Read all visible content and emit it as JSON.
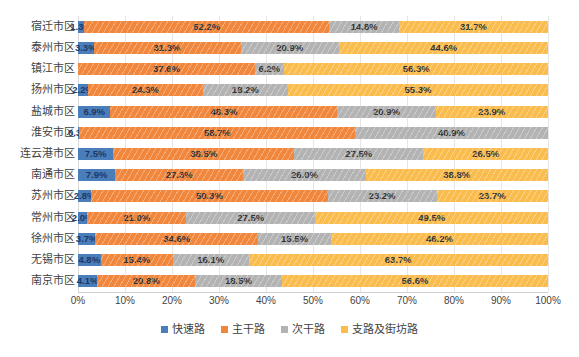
{
  "chart_data": {
    "type": "bar",
    "subtype": "stacked-100-horizontal",
    "title": "",
    "xlabel": "",
    "ylabel": "",
    "xlim": [
      0,
      100
    ],
    "grid": true,
    "legend_position": "bottom",
    "x_ticks": [
      "0%",
      "10%",
      "20%",
      "30%",
      "40%",
      "50%",
      "60%",
      "70%",
      "80%",
      "90%",
      "100%"
    ],
    "x_tick_values": [
      0,
      10,
      20,
      30,
      40,
      50,
      60,
      70,
      80,
      90,
      100
    ],
    "categories": [
      "宿迁市区",
      "泰州市区",
      "镇江市区",
      "扬州市区",
      "盐城市区",
      "淮安市区",
      "连云港市区",
      "南通市区",
      "苏州市区",
      "常州市区",
      "徐州市区",
      "无锡市区",
      "南京市区"
    ],
    "series": [
      {
        "name": "快速路",
        "color": "#4a7ebb",
        "values": [
          1.3,
          3.3,
          0.0,
          2.2,
          6.9,
          0.3,
          7.5,
          7.9,
          2.8,
          2.0,
          3.7,
          4.8,
          4.1
        ],
        "labels": [
          "1.3%",
          "3.3%",
          "",
          "2.2%",
          "6.9%",
          "0.3%",
          "7.5%",
          "7.9%",
          "2.8%",
          "2.0%",
          "3.7%",
          "4.8%",
          "4.1%"
        ]
      },
      {
        "name": "主干路",
        "color": "#f1863d",
        "values": [
          52.2,
          31.3,
          37.6,
          24.3,
          48.3,
          58.7,
          38.5,
          27.3,
          50.3,
          21.0,
          34.6,
          15.4,
          20.8
        ],
        "labels": [
          "52.2%",
          "31.3%",
          "37.6%",
          "24.3%",
          "48.3%",
          "58.7%",
          "38.5%",
          "27.3%",
          "50.3%",
          "21.0%",
          "34.6%",
          "15.4%",
          "20.8%"
        ]
      },
      {
        "name": "次干路",
        "color": "#b3b3b3",
        "values": [
          14.8,
          20.9,
          6.2,
          18.2,
          20.9,
          40.9,
          27.5,
          26.0,
          23.2,
          27.5,
          15.5,
          16.1,
          18.5
        ],
        "labels": [
          "14.8%",
          "20.9%",
          "6.2%",
          "18.2%",
          "20.9%",
          "40.9%",
          "27.5%",
          "26.0%",
          "23.2%",
          "27.5%",
          "15.5%",
          "16.1%",
          "18.5%"
        ]
      },
      {
        "name": "支路及街坊路",
        "color": "#fbbc4e",
        "values": [
          31.7,
          44.6,
          56.3,
          55.3,
          23.9,
          0.0,
          26.5,
          38.8,
          23.7,
          49.5,
          46.2,
          63.7,
          56.6
        ],
        "labels": [
          "31.7%",
          "44.6%",
          "56.3%",
          "55.3%",
          "23.9%",
          "",
          "26.5%",
          "38.8%",
          "23.7%",
          "49.5%",
          "46.2%",
          "63.7%",
          "56.6%"
        ]
      }
    ]
  },
  "legend": {
    "items": [
      {
        "label": "快速路",
        "color": "#4a7ebb"
      },
      {
        "label": "主干路",
        "color": "#f1863d"
      },
      {
        "label": "次干路",
        "color": "#b3b3b3"
      },
      {
        "label": "支路及街坊路",
        "color": "#fbbc4e"
      }
    ]
  },
  "colors": {
    "kuaisu": "#4a7ebb",
    "zhugan": "#f1863d",
    "cigan": "#b3b3b3",
    "zhilu": "#fbbc4e",
    "gridline": "#e6e6e6",
    "text": "#3f3f3f",
    "background": "#ffffff"
  }
}
